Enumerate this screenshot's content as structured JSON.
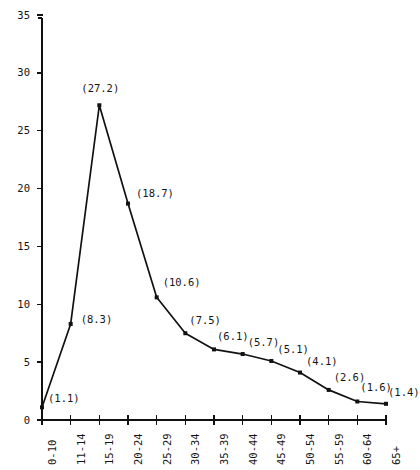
{
  "chart_data": {
    "type": "line",
    "title": "",
    "subtitle": "",
    "xlabel": "",
    "ylabel": "",
    "categories": [
      "0-10",
      "11-14",
      "15-19",
      "20-24",
      "25-29",
      "30-34",
      "35-39",
      "40-44",
      "45-49",
      "50-54",
      "55-59",
      "60-64",
      "65+"
    ],
    "values": [
      1.1,
      8.3,
      27.2,
      18.7,
      10.6,
      7.5,
      6.1,
      5.7,
      5.1,
      4.1,
      2.6,
      1.6,
      1.4
    ],
    "point_labels": [
      "(1.1)",
      "(8.3)",
      "(27.2)",
      "(18.7)",
      "(10.6)",
      "(7.5)",
      "(6.1)",
      "(5.7)",
      "(5.1)",
      "(4.1)",
      "(2.6)",
      "(1.6)",
      "(1.4)"
    ],
    "ylim": [
      0,
      35
    ],
    "yticks": [
      0,
      5,
      10,
      15,
      20,
      25,
      30,
      35
    ],
    "ytick_labels": [
      "0",
      "5",
      "10",
      "15",
      "20",
      "25",
      "30",
      "35"
    ],
    "grid": false,
    "legend": null,
    "series_color": "#111111",
    "marker": "square-dot",
    "xtick_rotation": -90
  },
  "axes": {
    "y_axis_name": "value-axis",
    "x_axis_name": "age-group-axis"
  }
}
